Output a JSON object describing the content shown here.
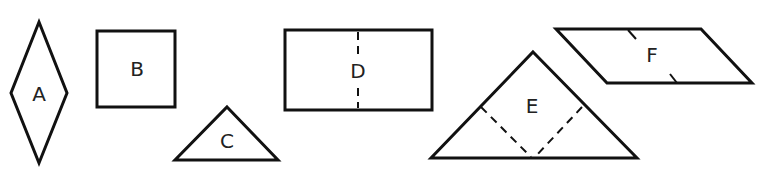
{
  "figure": {
    "stroke_color": "#111111",
    "background": "#ffffff"
  },
  "shapes": [
    {
      "label": "A",
      "type": "rhombus",
      "points": [
        [
          39,
          22
        ],
        [
          67,
          93
        ],
        [
          39,
          163
        ],
        [
          11,
          93
        ]
      ],
      "label_pos": [
        39,
        95
      ]
    },
    {
      "label": "B",
      "type": "square",
      "points": [
        [
          97,
          31
        ],
        [
          175,
          31
        ],
        [
          175,
          107
        ],
        [
          97,
          107
        ]
      ],
      "label_pos": [
        137,
        70
      ]
    },
    {
      "label": "C",
      "type": "triangle",
      "points": [
        [
          227,
          107
        ],
        [
          278,
          160
        ],
        [
          175,
          160
        ]
      ],
      "label_pos": [
        227,
        142
      ]
    },
    {
      "label": "D",
      "type": "rectangle",
      "points": [
        [
          285,
          30
        ],
        [
          432,
          30
        ],
        [
          432,
          110
        ],
        [
          285,
          110
        ]
      ],
      "label_pos": [
        358,
        71
      ],
      "fold_line": [
        [
          358,
          32
        ],
        [
          358,
          108
        ]
      ]
    },
    {
      "label": "E",
      "type": "triangle",
      "points": [
        [
          533,
          52
        ],
        [
          637,
          158
        ],
        [
          431,
          158
        ]
      ],
      "label_pos": [
        532,
        107
      ],
      "fold_lines": [
        [
          [
            481,
            107
          ],
          [
            531,
            157
          ]
        ],
        [
          [
            582,
            107
          ],
          [
            535,
            157
          ]
        ]
      ]
    },
    {
      "label": "F",
      "type": "parallelogram",
      "points": [
        [
          556,
          29
        ],
        [
          701,
          29
        ],
        [
          752,
          83
        ],
        [
          607,
          83
        ]
      ],
      "label_pos": [
        652,
        56
      ],
      "ticks": [
        [
          [
            628,
            30
          ],
          [
            636,
            39
          ]
        ],
        [
          [
            670,
            74
          ],
          [
            677,
            83
          ]
        ]
      ]
    }
  ]
}
